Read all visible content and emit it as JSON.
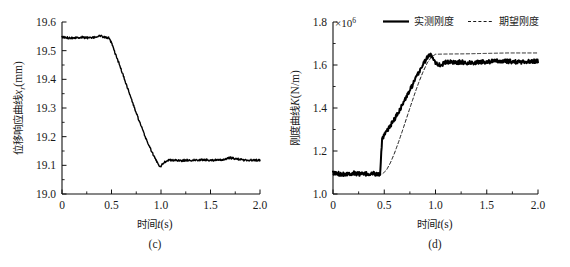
{
  "figure": {
    "panels": [
      {
        "caption": "(c)",
        "xlabel_cjk": "时间",
        "xlabel_var": "t",
        "xlabel_unit": "(s)",
        "ylabel_cjk": "位移响应曲线",
        "ylabel_var": "x",
        "ylabel_sub": "r",
        "ylabel_unit": "(mm)",
        "exponent_prefix": "",
        "exponent_base": "",
        "exponent_power": ""
      },
      {
        "caption": "(d)",
        "xlabel_cjk": "时间",
        "xlabel_var": "t",
        "xlabel_unit": "(s)",
        "ylabel_cjk": "刚度曲线",
        "ylabel_var": "K",
        "ylabel_sub": "",
        "ylabel_unit": "(N/m)",
        "exponent_prefix": "×",
        "exponent_base": "10",
        "exponent_power": "6"
      }
    ]
  },
  "legend": {
    "position": "top-right",
    "entries": [
      {
        "label": "实测刚度",
        "style": "solid",
        "color": "#000000",
        "width": 2.2
      },
      {
        "label": "期望刚度",
        "style": "dashed",
        "color": "#000000",
        "width": 0.9
      }
    ]
  },
  "chart_data": [
    {
      "type": "line",
      "panel": "(c)",
      "title": "",
      "xlabel": "时间t(s)",
      "ylabel": "位移响应曲线xr(mm)",
      "xlim": [
        0,
        2.0
      ],
      "ylim": [
        19.0,
        19.6
      ],
      "xticks": [
        0,
        0.5,
        1.0,
        1.5,
        2.0
      ],
      "xticklabels": [
        "0",
        "0.5",
        "1.0",
        "1.5",
        "2.0"
      ],
      "yticks": [
        19.0,
        19.1,
        19.2,
        19.3,
        19.4,
        19.5,
        19.6
      ],
      "yticklabels": [
        "19.0",
        "19.1",
        "19.2",
        "19.3",
        "19.4",
        "19.5",
        "19.6"
      ],
      "grid": false,
      "minor_ticks": true,
      "spines": [
        "left",
        "bottom"
      ],
      "series": [
        {
          "name": "位移响应",
          "style": "solid",
          "color": "#000000",
          "width": 1.4,
          "noise_amplitude": 0.006,
          "description": "Holds at 19.545 until t=0.47, descends in stair steps to a minimum undershoot of 19.095 at t=0.99, then recovers and holds flat at 19.118 through t=2.0",
          "keypoints": [
            {
              "x": 0.0,
              "y": 19.546
            },
            {
              "x": 0.1,
              "y": 19.545
            },
            {
              "x": 0.2,
              "y": 19.547
            },
            {
              "x": 0.3,
              "y": 19.544
            },
            {
              "x": 0.38,
              "y": 19.552
            },
            {
              "x": 0.44,
              "y": 19.546
            },
            {
              "x": 0.47,
              "y": 19.545
            },
            {
              "x": 0.5,
              "y": 19.527
            },
            {
              "x": 0.53,
              "y": 19.497
            },
            {
              "x": 0.56,
              "y": 19.47
            },
            {
              "x": 0.6,
              "y": 19.432
            },
            {
              "x": 0.64,
              "y": 19.392
            },
            {
              "x": 0.68,
              "y": 19.352
            },
            {
              "x": 0.72,
              "y": 19.312
            },
            {
              "x": 0.76,
              "y": 19.273
            },
            {
              "x": 0.8,
              "y": 19.236
            },
            {
              "x": 0.84,
              "y": 19.2
            },
            {
              "x": 0.88,
              "y": 19.168
            },
            {
              "x": 0.92,
              "y": 19.138
            },
            {
              "x": 0.95,
              "y": 19.118
            },
            {
              "x": 0.99,
              "y": 19.095
            },
            {
              "x": 1.03,
              "y": 19.11
            },
            {
              "x": 1.07,
              "y": 19.118
            },
            {
              "x": 1.2,
              "y": 19.117
            },
            {
              "x": 1.4,
              "y": 19.119
            },
            {
              "x": 1.6,
              "y": 19.118
            },
            {
              "x": 1.7,
              "y": 19.126
            },
            {
              "x": 1.85,
              "y": 19.118
            },
            {
              "x": 2.0,
              "y": 19.118
            }
          ]
        }
      ]
    },
    {
      "type": "line",
      "panel": "(d)",
      "title": "",
      "xlabel": "时间t(s)",
      "ylabel": "刚度曲线K(N/m)",
      "y_scale_exponent": "×10⁶",
      "xlim": [
        0,
        2.0
      ],
      "ylim": [
        1.0,
        1.8
      ],
      "xticks": [
        0,
        0.5,
        1.0,
        1.5,
        2.0
      ],
      "xticklabels": [
        "0",
        "0.5",
        "1.0",
        "1.5",
        "2.0"
      ],
      "yticks": [
        1.0,
        1.2,
        1.4,
        1.6,
        1.8
      ],
      "yticklabels": [
        "1.0",
        "1.2",
        "1.4",
        "1.6",
        "1.8"
      ],
      "grid": false,
      "minor_ticks": true,
      "spines": [
        "left",
        "bottom"
      ],
      "series": [
        {
          "name": "实测刚度",
          "style": "solid",
          "color": "#000000",
          "width": 2.0,
          "noise_amplitude": 0.012,
          "description": "Flat noisy baseline at 1.095 until t=0.46, sharp jump to 1.26, noisy ramp up to peak overshoot 1.648 at t=0.95, dips to 1.600 then settles noisy at 1.615",
          "keypoints": [
            {
              "x": 0.0,
              "y": 1.096
            },
            {
              "x": 0.1,
              "y": 1.093
            },
            {
              "x": 0.2,
              "y": 1.097
            },
            {
              "x": 0.3,
              "y": 1.092
            },
            {
              "x": 0.4,
              "y": 1.095
            },
            {
              "x": 0.45,
              "y": 1.09
            },
            {
              "x": 0.46,
              "y": 1.098
            },
            {
              "x": 0.47,
              "y": 1.18
            },
            {
              "x": 0.48,
              "y": 1.255
            },
            {
              "x": 0.5,
              "y": 1.272
            },
            {
              "x": 0.53,
              "y": 1.295
            },
            {
              "x": 0.56,
              "y": 1.318
            },
            {
              "x": 0.6,
              "y": 1.348
            },
            {
              "x": 0.64,
              "y": 1.382
            },
            {
              "x": 0.68,
              "y": 1.418
            },
            {
              "x": 0.72,
              "y": 1.455
            },
            {
              "x": 0.76,
              "y": 1.492
            },
            {
              "x": 0.8,
              "y": 1.53
            },
            {
              "x": 0.84,
              "y": 1.568
            },
            {
              "x": 0.88,
              "y": 1.605
            },
            {
              "x": 0.92,
              "y": 1.635
            },
            {
              "x": 0.95,
              "y": 1.648
            },
            {
              "x": 0.98,
              "y": 1.632
            },
            {
              "x": 1.01,
              "y": 1.605
            },
            {
              "x": 1.05,
              "y": 1.6
            },
            {
              "x": 1.1,
              "y": 1.612
            },
            {
              "x": 1.2,
              "y": 1.614
            },
            {
              "x": 1.35,
              "y": 1.61
            },
            {
              "x": 1.5,
              "y": 1.616
            },
            {
              "x": 1.65,
              "y": 1.618
            },
            {
              "x": 1.8,
              "y": 1.614
            },
            {
              "x": 2.0,
              "y": 1.618
            }
          ]
        },
        {
          "name": "期望刚度",
          "style": "dashed",
          "color": "#000000",
          "width": 0.9,
          "noise_amplitude": 0,
          "description": "Flat at 1.090 until t=0.47, smooth S-curve rise reaching 1.650 at t=1.00, then gently asymptotes to 1.656",
          "keypoints": [
            {
              "x": 0.0,
              "y": 1.09
            },
            {
              "x": 0.3,
              "y": 1.09
            },
            {
              "x": 0.45,
              "y": 1.09
            },
            {
              "x": 0.48,
              "y": 1.093
            },
            {
              "x": 0.52,
              "y": 1.11
            },
            {
              "x": 0.56,
              "y": 1.145
            },
            {
              "x": 0.6,
              "y": 1.19
            },
            {
              "x": 0.64,
              "y": 1.242
            },
            {
              "x": 0.68,
              "y": 1.298
            },
            {
              "x": 0.72,
              "y": 1.356
            },
            {
              "x": 0.76,
              "y": 1.414
            },
            {
              "x": 0.8,
              "y": 1.47
            },
            {
              "x": 0.84,
              "y": 1.523
            },
            {
              "x": 0.88,
              "y": 1.57
            },
            {
              "x": 0.92,
              "y": 1.61
            },
            {
              "x": 0.96,
              "y": 1.637
            },
            {
              "x": 1.0,
              "y": 1.65
            },
            {
              "x": 1.1,
              "y": 1.651
            },
            {
              "x": 1.3,
              "y": 1.652
            },
            {
              "x": 1.5,
              "y": 1.654
            },
            {
              "x": 1.7,
              "y": 1.656
            },
            {
              "x": 2.0,
              "y": 1.656
            }
          ]
        }
      ]
    }
  ]
}
